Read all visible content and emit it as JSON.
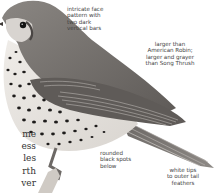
{
  "illustration": {
    "subject": "thrush-bird-illustration",
    "colors": {
      "back": "#6f6a66",
      "wing": "#5d5956",
      "belly": "#e9e6e1",
      "spots": "#1e1c1b",
      "eye": "#141414",
      "text": "#444444"
    }
  },
  "callouts": {
    "face": "intricate face\npattern with\ntwo dark\nvertical bars",
    "size": "larger than\nAmerican Robin;\nlarger and grayer\nthan Song Thrush",
    "spots": "rounded\nblack spots\nbelow",
    "tail": "white tips\nto outer tail\nfeathers"
  },
  "body_text": {
    "lines": [
      "me",
      "ess",
      "les",
      "rth",
      "ver"
    ]
  }
}
